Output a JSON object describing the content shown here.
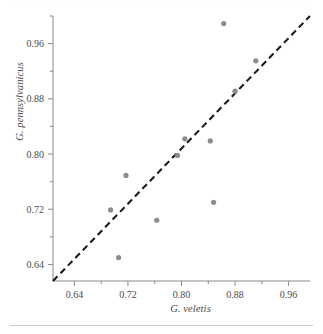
{
  "figure": {
    "background": "#ffffff",
    "point_color": "#8c8c8c",
    "line_color": "#1c1c1c",
    "axis_color": "#8a8a8a"
  },
  "axes": {
    "x_label": "G. veletis",
    "y_label": "G. pennsylvanicus",
    "x_ticks": [
      "0.64",
      "0.72",
      "0.80",
      "0.88",
      "0.96"
    ],
    "y_ticks": [
      "0.64",
      "0.72",
      "0.80",
      "0.88",
      "0.96"
    ]
  },
  "chart_data": {
    "type": "scatter",
    "title": "",
    "xlabel": "G. veletis",
    "ylabel": "G. pennsylvanicus",
    "xlim": [
      0.608,
      0.992
    ],
    "ylim": [
      0.616,
      1.0
    ],
    "xticks": [
      0.64,
      0.72,
      0.8,
      0.88,
      0.96
    ],
    "yticks": [
      0.64,
      0.72,
      0.8,
      0.88,
      0.96
    ],
    "xtick_labels": [
      "0.64",
      "0.72",
      "0.80",
      "0.88",
      "0.96"
    ],
    "ytick_labels": [
      "0.64",
      "0.72",
      "0.80",
      "0.88",
      "0.96"
    ],
    "minor_ticks": true,
    "grid": false,
    "legend": null,
    "series": [
      {
        "name": "samples",
        "marker": "circle",
        "color": "#8c8c8c",
        "points": [
          {
            "x": 0.863,
            "y": 0.989
          },
          {
            "x": 0.911,
            "y": 0.935
          },
          {
            "x": 0.88,
            "y": 0.891
          },
          {
            "x": 0.843,
            "y": 0.819
          },
          {
            "x": 0.805,
            "y": 0.822
          },
          {
            "x": 0.794,
            "y": 0.798
          },
          {
            "x": 0.848,
            "y": 0.73
          },
          {
            "x": 0.717,
            "y": 0.769
          },
          {
            "x": 0.694,
            "y": 0.719
          },
          {
            "x": 0.763,
            "y": 0.704
          },
          {
            "x": 0.706,
            "y": 0.65
          }
        ]
      }
    ],
    "reference_line": {
      "type": "dashed",
      "style": "1:1 identity line",
      "from": {
        "x": 0.608,
        "y": 0.616
      },
      "to": {
        "x": 0.992,
        "y": 1.0
      },
      "color": "#1c1c1c"
    }
  }
}
